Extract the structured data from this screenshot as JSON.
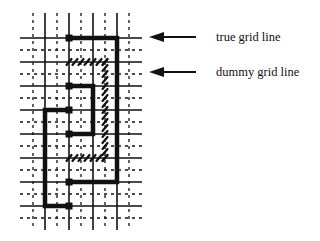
{
  "diagram": {
    "type": "grid-routing-illustration",
    "grid": {
      "true_lines_x": [
        45,
        69,
        93,
        117
      ],
      "dummy_lines_x": [
        33,
        57,
        81,
        105,
        129
      ],
      "true_lines_y": [
        38,
        62,
        86,
        110,
        134,
        158,
        182,
        206
      ],
      "dummy_lines_y": [
        50,
        74,
        98,
        122,
        146,
        170,
        194,
        218
      ],
      "x_extent": [
        20,
        142
      ],
      "y_extent": [
        13,
        230
      ]
    },
    "thick_paths": [
      {
        "name": "outer-route",
        "points": [
          [
            69,
            38
          ],
          [
            117,
            38
          ],
          [
            117,
            182
          ],
          [
            69,
            182
          ]
        ]
      },
      {
        "name": "inner-route",
        "points": [
          [
            69,
            86
          ],
          [
            93,
            86
          ],
          [
            93,
            134
          ],
          [
            69,
            134
          ]
        ]
      },
      {
        "name": "left-route",
        "points": [
          [
            69,
            110
          ],
          [
            45,
            110
          ],
          [
            45,
            206
          ],
          [
            69,
            206
          ]
        ]
      }
    ],
    "hatched_paths": [
      {
        "name": "dummy-route",
        "points": [
          [
            69,
            62
          ],
          [
            105,
            62
          ],
          [
            105,
            158
          ],
          [
            69,
            158
          ]
        ]
      }
    ],
    "annotations": [
      {
        "label": "true grid line",
        "arrow_y": 37,
        "text_y": 31
      },
      {
        "label": "dummy grid line",
        "arrow_y": 72,
        "text_y": 66
      }
    ],
    "colors": {
      "line": "#111111",
      "background": "#ffffff"
    }
  }
}
